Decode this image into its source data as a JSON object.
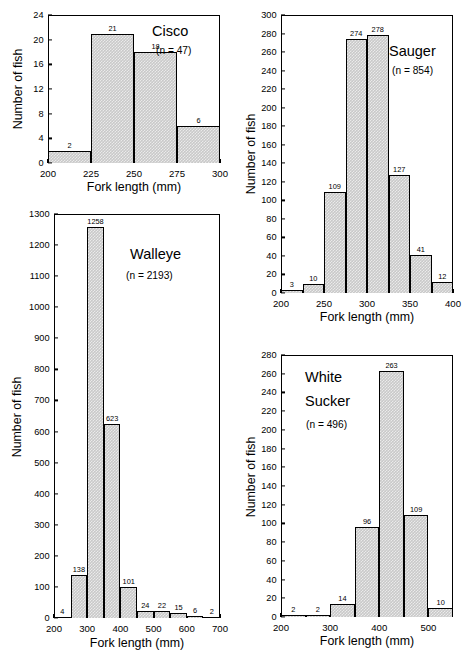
{
  "figure": {
    "axis_label_x": "Fork length (mm)",
    "axis_label_y": "Number of fish"
  },
  "chart_data": [
    {
      "type": "bar",
      "title": "Cisco",
      "n_label": "(n = 47)",
      "n": 47,
      "xlabel": "Fork length (mm)",
      "ylabel": "Number of fish",
      "xlim": [
        200,
        300
      ],
      "ylim": [
        0,
        24
      ],
      "xticks": [
        200,
        225,
        250,
        275,
        300
      ],
      "yticks": [
        0,
        4,
        8,
        12,
        16,
        20,
        24
      ],
      "bin_width": 25,
      "bin_edges": [
        200,
        225,
        250,
        275,
        300
      ],
      "categories": [
        "200-225",
        "225-250",
        "250-275",
        "275-300"
      ],
      "values": [
        2,
        21,
        18,
        6
      ],
      "grid": false,
      "legend": "none"
    },
    {
      "type": "bar",
      "title": "Sauger",
      "n_label": "(n = 854)",
      "n": 854,
      "xlabel": "Fork length (mm)",
      "ylabel": "Number of fish",
      "xlim": [
        200,
        400
      ],
      "ylim": [
        0,
        300
      ],
      "xticks": [
        200,
        250,
        300,
        350,
        400
      ],
      "yticks": [
        0,
        20,
        40,
        60,
        80,
        100,
        120,
        140,
        160,
        180,
        200,
        220,
        240,
        260,
        280,
        300
      ],
      "bin_width": 25,
      "bin_edges": [
        200,
        225,
        250,
        275,
        300,
        325,
        350,
        375,
        400
      ],
      "categories": [
        "200-225",
        "225-250",
        "250-275",
        "275-300",
        "300-325",
        "325-350",
        "350-375",
        "375-400"
      ],
      "values": [
        3,
        10,
        109,
        274,
        278,
        127,
        41,
        12
      ],
      "grid": false,
      "legend": "none"
    },
    {
      "type": "bar",
      "title": "Walleye",
      "n_label": "(n = 2193)",
      "n": 2193,
      "xlabel": "Fork length (mm)",
      "ylabel": "Number of fish",
      "xlim": [
        200,
        700
      ],
      "ylim": [
        0,
        1300
      ],
      "xticks": [
        200,
        300,
        400,
        500,
        600,
        700
      ],
      "yticks": [
        0,
        100,
        200,
        300,
        400,
        500,
        600,
        700,
        800,
        900,
        1000,
        1100,
        1200,
        1300
      ],
      "bin_width": 50,
      "bin_edges": [
        200,
        250,
        300,
        350,
        400,
        450,
        500,
        550,
        600,
        650,
        700
      ],
      "categories": [
        "200-250",
        "250-300",
        "300-350",
        "350-400",
        "400-450",
        "450-500",
        "500-550",
        "550-600",
        "600-650",
        "650-700"
      ],
      "values": [
        4,
        138,
        1258,
        623,
        101,
        24,
        22,
        15,
        6,
        2
      ],
      "grid": false,
      "legend": "none"
    },
    {
      "type": "bar",
      "title_line1": "White",
      "title_line2": "Sucker",
      "title": "White Sucker",
      "n_label": "(n = 496)",
      "n": 496,
      "xlabel": "Fork length (mm)",
      "ylabel": "Number of fish",
      "xlim": [
        200,
        550
      ],
      "ylim": [
        0,
        280
      ],
      "xticks": [
        200,
        300,
        400,
        500
      ],
      "yticks": [
        0,
        20,
        40,
        60,
        80,
        100,
        120,
        140,
        160,
        180,
        200,
        220,
        240,
        260,
        280
      ],
      "bin_width": 50,
      "bin_edges": [
        200,
        250,
        300,
        350,
        400,
        450,
        500,
        550
      ],
      "categories": [
        "200-250",
        "250-300",
        "300-350",
        "350-400",
        "400-450",
        "450-500",
        "500-550"
      ],
      "values": [
        2,
        2,
        14,
        96,
        263,
        109,
        10
      ],
      "grid": false,
      "legend": "none"
    }
  ]
}
